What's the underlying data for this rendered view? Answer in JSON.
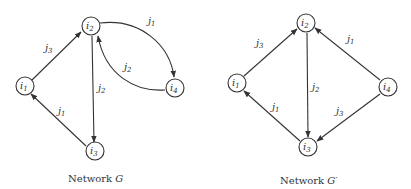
{
  "diagrams": [
    {
      "id": "G",
      "caption_text": "Network ",
      "caption_symbol": "G",
      "nodes": [
        {
          "id": "i1",
          "base": "i",
          "sub": "1"
        },
        {
          "id": "i2",
          "base": "i",
          "sub": "2"
        },
        {
          "id": "i3",
          "base": "i",
          "sub": "3"
        },
        {
          "id": "i4",
          "base": "i",
          "sub": "4"
        }
      ],
      "edges": [
        {
          "from": "i1",
          "to": "i2",
          "label_base": "j",
          "label_sub": "3",
          "curved": false
        },
        {
          "from": "i2",
          "to": "i3",
          "label_base": "j",
          "label_sub": "2",
          "curved": false
        },
        {
          "from": "i3",
          "to": "i1",
          "label_base": "j",
          "label_sub": "1",
          "curved": false
        },
        {
          "from": "i2",
          "to": "i4",
          "label_base": "j",
          "label_sub": "1",
          "curved": true
        },
        {
          "from": "i4",
          "to": "i2",
          "label_base": "j",
          "label_sub": "2",
          "curved": true
        }
      ]
    },
    {
      "id": "G-prime",
      "caption_text": "Network ",
      "caption_symbol": "G′",
      "nodes": [
        {
          "id": "i1",
          "base": "i",
          "sub": "1"
        },
        {
          "id": "i2",
          "base": "i",
          "sub": "2"
        },
        {
          "id": "i3",
          "base": "i",
          "sub": "3"
        },
        {
          "id": "i4",
          "base": "i",
          "sub": "4"
        }
      ],
      "edges": [
        {
          "from": "i1",
          "to": "i2",
          "label_base": "j",
          "label_sub": "3",
          "curved": false
        },
        {
          "from": "i2",
          "to": "i3",
          "label_base": "j",
          "label_sub": "2",
          "curved": false
        },
        {
          "from": "i3",
          "to": "i1",
          "label_base": "j",
          "label_sub": "1",
          "curved": false
        },
        {
          "from": "i4",
          "to": "i2",
          "label_base": "j",
          "label_sub": "1",
          "curved": false
        },
        {
          "from": "i4",
          "to": "i3",
          "label_base": "j",
          "label_sub": "3",
          "curved": false
        }
      ]
    }
  ]
}
